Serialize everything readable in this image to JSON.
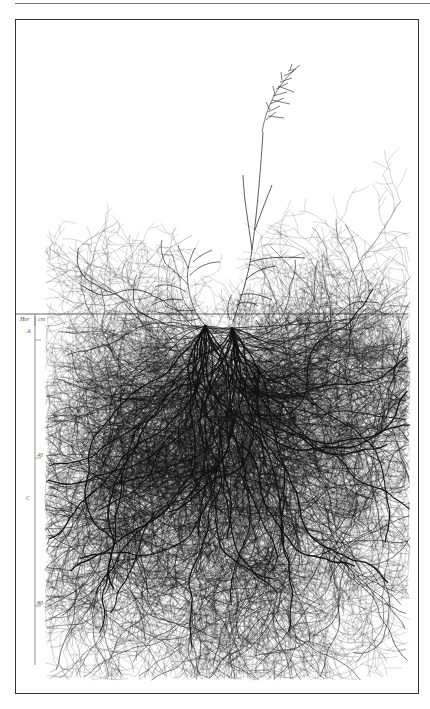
{
  "figure": {
    "type": "botanical root system drawing",
    "header_text_visible": false
  },
  "axis": {
    "horizon_header": "Hor",
    "unit_header": "cm",
    "horizons": [
      {
        "label": "A",
        "y": 328
      },
      {
        "label": "C",
        "y": 495
      }
    ],
    "depth_ticks": [
      {
        "label": "40",
        "y": 452
      },
      {
        "label": "80",
        "y": 600
      }
    ]
  },
  "colors": {
    "ink": "#111111",
    "frame": "#333333",
    "label": "#555555",
    "background": "#ffffff"
  }
}
